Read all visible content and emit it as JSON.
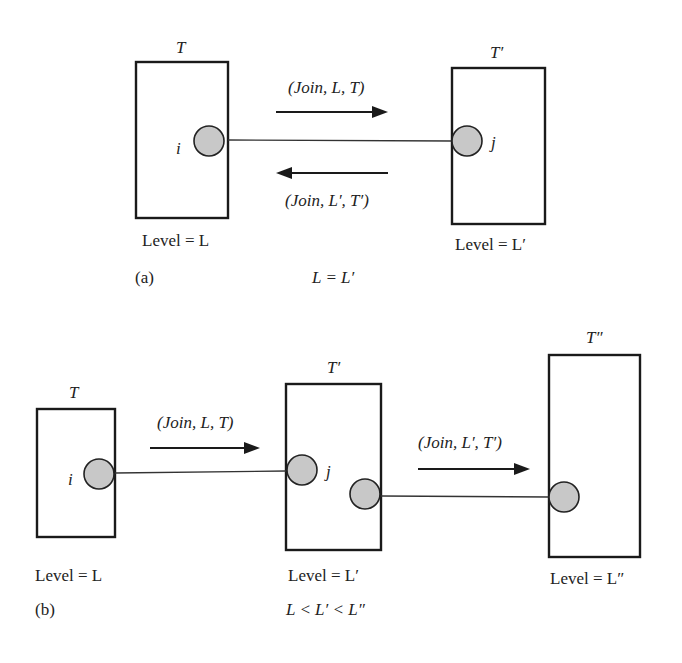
{
  "panel_a": {
    "tag": "(a)",
    "left_node": {
      "title": "T",
      "port": "i",
      "level": "Level = L"
    },
    "right_node": {
      "title": "T′",
      "port": "j",
      "level": "Level = L′"
    },
    "msg_forward": "(Join, L, T)",
    "msg_back": "(Join, L′, T′)",
    "condition": "L = L′"
  },
  "panel_b": {
    "tag": "(b)",
    "node1": {
      "title": "T",
      "port": "i",
      "level": "Level = L"
    },
    "node2": {
      "title": "T′",
      "port": "j",
      "level": "Level = L′"
    },
    "node3": {
      "title": "T″",
      "level": "Level = L″"
    },
    "msg1": "(Join, L, T)",
    "msg2": "(Join, L′, T′)",
    "condition": "L < L′ < L″"
  },
  "colors": {
    "node_fill": "#c8c8c8",
    "stroke": "#1a1a1a"
  }
}
